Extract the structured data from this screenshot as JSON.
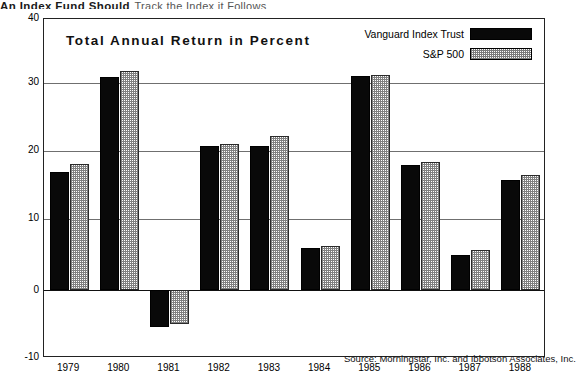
{
  "page_header": {
    "bold_text": "An Index Fund Should",
    "light_text": "Track the Index it Follows"
  },
  "chart_title": "Total Annual Return in Percent",
  "source_note": "Source: Morningstar, Inc. and Ibbotson Associates, Inc.",
  "legend": {
    "position": "top-right",
    "items": [
      {
        "label": "Vanguard Index Trust",
        "swatch": "solid-black"
      },
      {
        "label": "S&P 500",
        "swatch": "dotted-gray"
      }
    ]
  },
  "axes": {
    "y_ticks": [
      "40",
      "30",
      "20",
      "10",
      "0",
      "-10"
    ],
    "y_min": -10,
    "y_max": 40,
    "x_ticks": [
      "1979",
      "1980",
      "1981",
      "1982",
      "1983",
      "1984",
      "1985",
      "1986",
      "1987",
      "1988"
    ]
  },
  "chart_data": {
    "type": "bar",
    "title": "Total Annual Return in Percent",
    "xlabel": "",
    "ylabel": "Percent",
    "ylim": [
      -10,
      40
    ],
    "grid": true,
    "legend_position": "top-right",
    "categories": [
      "1979",
      "1980",
      "1981",
      "1982",
      "1983",
      "1984",
      "1985",
      "1986",
      "1987",
      "1988"
    ],
    "series": [
      {
        "name": "Vanguard Index Trust",
        "color": "#090909",
        "values": [
          17.4,
          31.5,
          -5.4,
          21.3,
          21.3,
          6.2,
          31.6,
          18.5,
          5.2,
          16.2
        ]
      },
      {
        "name": "S&P 500",
        "color": "#808080",
        "values": [
          18.6,
          32.4,
          -5.0,
          21.5,
          22.7,
          6.5,
          31.8,
          18.9,
          5.9,
          17.0
        ]
      }
    ],
    "annotations": [
      "Source: Morningstar, Inc. and Ibbotson Associates, Inc."
    ]
  }
}
